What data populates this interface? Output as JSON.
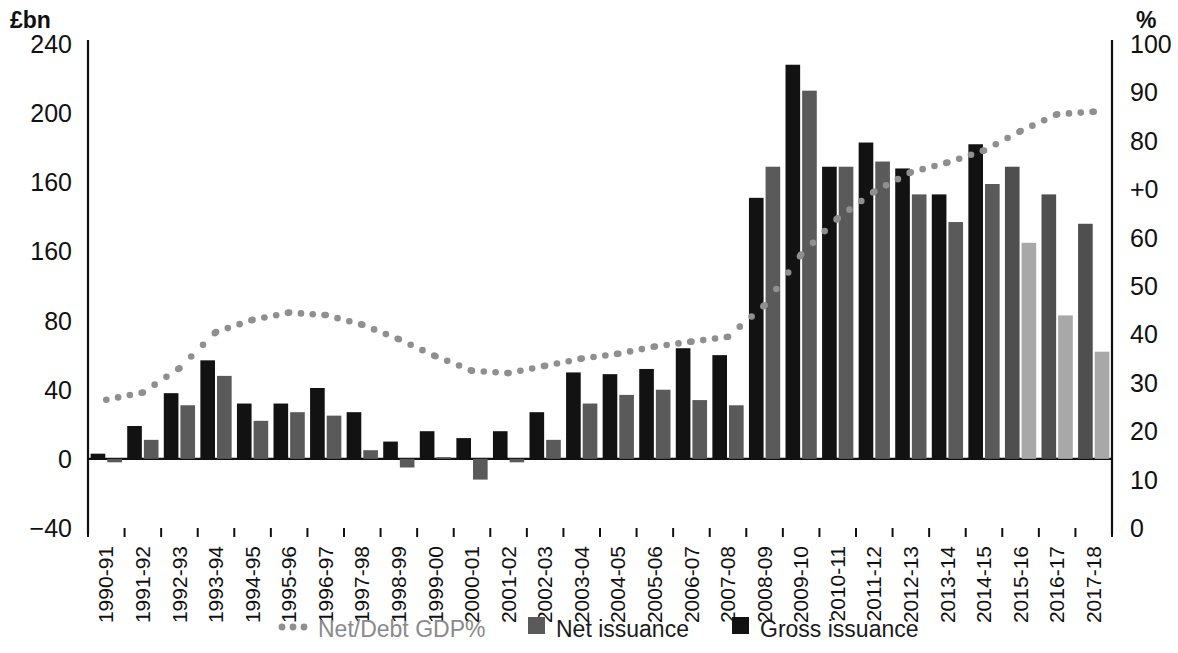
{
  "chart_data": {
    "type": "bar",
    "title": "",
    "subtitle": "",
    "xlabel": "",
    "ylabel": "£bn",
    "y2label": "%",
    "grid": false,
    "legend_position": "bottom",
    "ylim": [
      -40,
      240
    ],
    "y2lim": [
      0,
      100
    ],
    "y_ticks": [
      "240",
      "200",
      "160",
      "160",
      "80",
      "40",
      "0",
      "−40"
    ],
    "y_tick_values": [
      240,
      200,
      160,
      120,
      80,
      40,
      0,
      -40
    ],
    "y2_ticks": [
      "100",
      "90",
      "80",
      "+0",
      "60",
      "50",
      "40",
      "30",
      "20",
      "10",
      "0"
    ],
    "y2_tick_values": [
      100,
      90,
      80,
      70,
      60,
      50,
      40,
      30,
      20,
      10,
      0
    ],
    "categories": [
      "1990-91",
      "1991-92",
      "1992-93",
      "1993-94",
      "1994-95",
      "1995-96",
      "1996-97",
      "1997-98",
      "1998-99",
      "1999-00",
      "2000-01",
      "2001-02",
      "2002-03",
      "2003-04",
      "2004-05",
      "2005-06",
      "2006-07",
      "2007-08",
      "2008-09",
      "2009-10",
      "2010-11",
      "2011-12",
      "2012-13",
      "2013-14",
      "2014-15",
      "2015-16",
      "2016-17",
      "2017-18"
    ],
    "series": [
      {
        "name": "Gross issuance",
        "key": "gross",
        "type": "bar",
        "color": "#121212",
        "forecast_color": "#4f4f4f",
        "axis": "left",
        "values": [
          3,
          19,
          38,
          57,
          32,
          32,
          41,
          27,
          10,
          16,
          12,
          16,
          27,
          50,
          49,
          52,
          64,
          60,
          151,
          228,
          169,
          183,
          168,
          153,
          182,
          169,
          153,
          136
        ]
      },
      {
        "name": "Net issuance",
        "key": "net",
        "type": "bar",
        "color": "#5a5a5a",
        "forecast_color": "#a8a8a8",
        "axis": "left",
        "values": [
          -2,
          11,
          31,
          48,
          22,
          27,
          25,
          5,
          -5,
          1,
          -12,
          -2,
          11,
          32,
          37,
          40,
          34,
          31,
          169,
          213,
          169,
          172,
          153,
          137,
          159,
          125,
          83,
          62
        ]
      },
      {
        "name": "Net/Debt GDP%",
        "key": "ratio",
        "type": "line",
        "style": "dotted",
        "color": "#8f8f8f",
        "axis": "right",
        "values": [
          26.5,
          28.0,
          33.0,
          40.5,
          43.0,
          44.5,
          44.0,
          42.0,
          39.0,
          35.5,
          32.5,
          32.0,
          33.5,
          35.0,
          36.0,
          37.5,
          38.5,
          39.5,
          46.0,
          56.5,
          64.0,
          69.5,
          73.5,
          75.5,
          78.0,
          82.0,
          85.5,
          86.0
        ]
      }
    ],
    "forecast_from_index": 25,
    "legend": [
      {
        "label": "Net/Debt GDP%",
        "marker": "dots",
        "color": "#8f8f8f",
        "muted": true
      },
      {
        "label": "Net issuance",
        "marker": "square",
        "color": "#5a5a5a",
        "muted": false
      },
      {
        "label": "Gross issuance",
        "marker": "square",
        "color": "#121212",
        "muted": false
      }
    ]
  }
}
